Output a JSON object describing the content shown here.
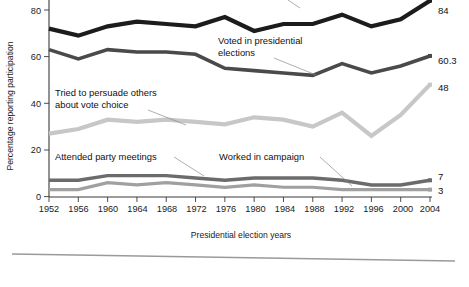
{
  "chart_data": {
    "type": "line",
    "title": "",
    "xlabel": "Presidential election years",
    "ylabel": "Percentage reporting participation",
    "x": [
      1952,
      1956,
      1960,
      1964,
      1968,
      1972,
      1976,
      1980,
      1984,
      1988,
      1992,
      1996,
      2000,
      2004
    ],
    "categories": [
      "1952",
      "1956",
      "1960",
      "1964",
      "1968",
      "1972",
      "1976",
      "1980",
      "1984",
      "1988",
      "1992",
      "1996",
      "2000",
      "2004"
    ],
    "xlim": [
      1952,
      2004
    ],
    "ylim": [
      0,
      88
    ],
    "yticks": [
      0,
      20,
      40,
      60,
      80
    ],
    "ytick_labels": [
      "0",
      "20",
      "40",
      "60",
      "80"
    ],
    "grid": false,
    "legend": "annotations-inline",
    "series": [
      {
        "name": "Voted in presidential elections",
        "color": "#1c1c1c",
        "end_label": "84",
        "values": [
          72,
          69,
          73,
          75,
          74,
          73,
          77,
          71,
          74,
          74,
          78,
          73,
          76,
          84
        ]
      },
      {
        "name": "Tried to persuade others about vote choice",
        "color": "#4a4a4a",
        "end_label": "60.3",
        "values": [
          63,
          59,
          63,
          62,
          62,
          61,
          55,
          54,
          53,
          52,
          57,
          53,
          56,
          60.3
        ]
      },
      {
        "name": "unlabeled-light-series",
        "color": "#c7c7c7",
        "end_label": "48",
        "values": [
          27,
          29,
          33,
          32,
          33,
          32,
          31,
          34,
          33,
          30,
          36,
          26,
          35,
          48
        ]
      },
      {
        "name": "Attended party meetings",
        "color": "#6b6b6b",
        "end_label": "7",
        "values": [
          7,
          7,
          9,
          9,
          9,
          8,
          7,
          8,
          8,
          8,
          7,
          5,
          5,
          7
        ]
      },
      {
        "name": "Worked in campaign",
        "color": "#a0a0a0",
        "end_label": "3",
        "values": [
          3,
          3,
          6,
          5,
          6,
          5,
          4,
          5,
          4,
          4,
          3,
          3,
          3,
          3
        ]
      }
    ],
    "annotations": [
      {
        "text_line1": "Voted in presidential",
        "text_line2": "elections"
      },
      {
        "text_line1": "Tried to persuade others",
        "text_line2": "about vote choice"
      },
      {
        "text_line1": "Attended party meetings",
        "text_line2": ""
      },
      {
        "text_line1": "Worked in campaign",
        "text_line2": ""
      }
    ],
    "end_labels": [
      "84",
      "60.3",
      "48",
      "7",
      "3"
    ]
  },
  "axis": {
    "ylabel": "Percentage reporting participation",
    "xlabel": "Presidential election years",
    "ytick_0": "0",
    "ytick_20": "20",
    "ytick_40": "40",
    "ytick_60": "60",
    "ytick_80": "80"
  },
  "xticks": {
    "t0": "1952",
    "t1": "1956",
    "t2": "1960",
    "t3": "1964",
    "t4": "1968",
    "t5": "1972",
    "t6": "1976",
    "t7": "1980",
    "t8": "1984",
    "t9": "1988",
    "t10": "1992",
    "t11": "1996",
    "t12": "2000",
    "t13": "2004"
  },
  "annotations": {
    "voted_l1": "Voted in presidential",
    "voted_l2": "elections",
    "persuade_l1": "Tried to persuade others",
    "persuade_l2": "about vote choice",
    "meetings": "Attended party meetings",
    "campaign": "Worked in campaign"
  },
  "end_labels": {
    "voted": "84",
    "persuade": "60.3",
    "light": "48",
    "meetings": "7",
    "campaign": "3"
  },
  "colors": {
    "voted": "#1c1c1c",
    "persuade": "#4a4a4a",
    "light": "#c7c7c7",
    "meetings": "#6b6b6b",
    "campaign": "#a0a0a0",
    "axis": "#3a3a3a",
    "rule": "#9a9a9a"
  }
}
